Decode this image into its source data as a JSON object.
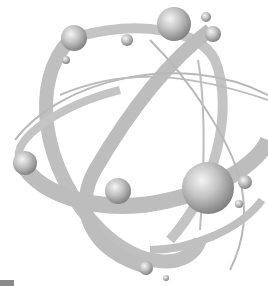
{
  "image": {
    "subject": "atom illustration",
    "colors": {
      "background": "#ffffff",
      "orbit": "#bdbdbd",
      "orbit_thin": "#b5b5b5",
      "sphere_light": "#f2f2f2",
      "sphere_mid": "#b8b8b8",
      "sphere_dark": "#7a7a7a"
    },
    "spheres": [
      {
        "cx": 74,
        "cy": 38,
        "r": 13
      },
      {
        "cx": 66,
        "cy": 60,
        "r": 4
      },
      {
        "cx": 127,
        "cy": 40,
        "r": 6
      },
      {
        "cx": 174,
        "cy": 24,
        "r": 17
      },
      {
        "cx": 206,
        "cy": 17,
        "r": 5
      },
      {
        "cx": 213,
        "cy": 34,
        "r": 8
      },
      {
        "cx": 25,
        "cy": 163,
        "r": 12
      },
      {
        "cx": 118,
        "cy": 191,
        "r": 13
      },
      {
        "cx": 208,
        "cy": 188,
        "r": 26
      },
      {
        "cx": 245,
        "cy": 182,
        "r": 7
      },
      {
        "cx": 239,
        "cy": 204,
        "r": 4
      },
      {
        "cx": 146,
        "cy": 268,
        "r": 7
      },
      {
        "cx": 166,
        "cy": 278,
        "r": 3
      }
    ]
  }
}
